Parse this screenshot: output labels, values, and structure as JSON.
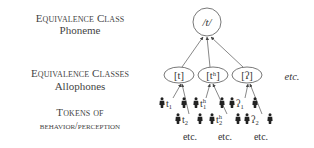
{
  "labels": {
    "phoneme_level": {
      "title": "Equivalence Class",
      "subtitle": "Phoneme"
    },
    "allophone_level": {
      "title": "Equivalence Classes",
      "subtitle": "Allophones"
    },
    "token_level": {
      "title": "Tokens of",
      "subtitle": "behavior/perception"
    }
  },
  "phoneme": {
    "symbol": "/t/"
  },
  "allophones": [
    {
      "symbol": "[t]"
    },
    {
      "symbol": "[tʰ]"
    },
    {
      "symbol": "[ʔ]"
    }
  ],
  "allophones_etc": "etc.",
  "tokens": [
    {
      "row1": {
        "base": "t",
        "sup": "",
        "sub": "1"
      },
      "row2": {
        "base": "t",
        "sup": "",
        "sub": "2"
      },
      "etc": "etc."
    },
    {
      "row1": {
        "base": "t",
        "sup": "h",
        "sub": "1"
      },
      "row2": {
        "base": "t",
        "sup": "h",
        "sub": "2"
      },
      "etc": "etc."
    },
    {
      "row1": {
        "base": "ʔ",
        "sup": "",
        "sub": "1"
      },
      "row2": {
        "base": "ʔ",
        "sup": "",
        "sub": "2"
      },
      "etc": "etc."
    }
  ],
  "icons": {
    "token_figure": "person-icon"
  }
}
